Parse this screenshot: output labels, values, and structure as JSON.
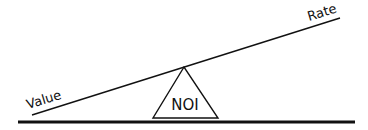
{
  "diagram": {
    "type": "seesaw",
    "beam_left_label": "Value",
    "beam_right_label": "Rate",
    "fulcrum_label": "NOI",
    "colors": {
      "line": "#111111",
      "background": "#ffffff"
    }
  }
}
